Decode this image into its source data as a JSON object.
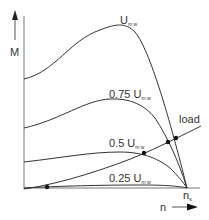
{
  "diagram": {
    "type": "motor torque-speed characteristics",
    "y_axis": {
      "label": "M",
      "has_arrow": true
    },
    "x_axis": {
      "label": "n",
      "has_arrow": true,
      "end_label": "n",
      "end_label_sub": "s"
    },
    "curves": [
      {
        "id": "u100",
        "label_prefix": "",
        "label_main": "U",
        "label_sub": "m w"
      },
      {
        "id": "u75",
        "label_prefix": "0.75 ",
        "label_main": "U",
        "label_sub": "m w"
      },
      {
        "id": "u50",
        "label_prefix": "0.5 ",
        "label_main": "U",
        "label_sub": "m w"
      },
      {
        "id": "u25",
        "label_prefix": "0.25 ",
        "label_main": "U",
        "label_sub": "m w"
      }
    ],
    "load_curve": {
      "label": "load"
    },
    "operating_points": 4,
    "colors": {
      "line": "#333333",
      "axis": "#444444",
      "background": "#ffffff"
    }
  }
}
